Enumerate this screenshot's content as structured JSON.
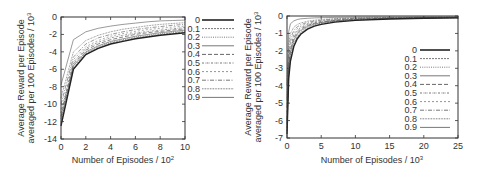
{
  "chart_data": [
    {
      "type": "line",
      "title": "",
      "xlabel": "Number of Episodes / 10",
      "xlabel_sup": "2",
      "ylabel_line1": "Average Reward per Episode",
      "ylabel_line2": "averaged per 100 Episodes / 10",
      "ylabel_sup": "3",
      "xlim": [
        0,
        10
      ],
      "ylim": [
        -14,
        0
      ],
      "xticks": [
        0,
        2,
        4,
        6,
        8,
        10
      ],
      "yticks": [
        0,
        -2,
        -4,
        -6,
        -8,
        -10,
        -12,
        -14
      ],
      "grid": false,
      "legend_position": "outside-right",
      "x": [
        0,
        1,
        2,
        3,
        4,
        5,
        6,
        7,
        8,
        9,
        10
      ],
      "series": [
        {
          "name": "0",
          "style": "solid-thick",
          "values": [
            -12.5,
            -6.0,
            -4.3,
            -3.6,
            -3.1,
            -2.8,
            -2.5,
            -2.3,
            -2.1,
            -1.95,
            -1.8
          ]
        },
        {
          "name": "0.1",
          "style": "dash-fine",
          "values": [
            -12.2,
            -5.9,
            -4.2,
            -3.5,
            -3.0,
            -2.7,
            -2.4,
            -2.2,
            -2.0,
            -1.85,
            -1.7
          ]
        },
        {
          "name": "0.2",
          "style": "dot",
          "values": [
            -12.0,
            -5.8,
            -4.1,
            -3.4,
            -2.9,
            -2.6,
            -2.3,
            -2.1,
            -1.9,
            -1.75,
            -1.6
          ]
        },
        {
          "name": "0.3",
          "style": "solid-thin",
          "values": [
            -11.7,
            -5.6,
            -4.0,
            -3.3,
            -2.8,
            -2.5,
            -2.2,
            -2.0,
            -1.8,
            -1.65,
            -1.5
          ]
        },
        {
          "name": "0.4",
          "style": "dash-long",
          "values": [
            -11.4,
            -5.4,
            -3.8,
            -3.1,
            -2.6,
            -2.3,
            -2.0,
            -1.8,
            -1.65,
            -1.5,
            -1.35
          ]
        },
        {
          "name": "0.5",
          "style": "dash-dot-fine",
          "values": [
            -11.0,
            -5.2,
            -3.6,
            -2.9,
            -2.4,
            -2.1,
            -1.85,
            -1.65,
            -1.5,
            -1.35,
            -1.2
          ]
        },
        {
          "name": "0.6",
          "style": "dash-short",
          "values": [
            -10.6,
            -4.9,
            -3.4,
            -2.7,
            -2.2,
            -1.9,
            -1.65,
            -1.45,
            -1.3,
            -1.15,
            -1.05
          ]
        },
        {
          "name": "0.7",
          "style": "dash-dot",
          "values": [
            -10.0,
            -4.6,
            -3.1,
            -2.4,
            -2.0,
            -1.7,
            -1.45,
            -1.25,
            -1.1,
            -0.95,
            -0.85
          ]
        },
        {
          "name": "0.8",
          "style": "dot-dense",
          "values": [
            -9.3,
            -4.0,
            -2.7,
            -2.1,
            -1.7,
            -1.4,
            -1.2,
            -1.0,
            -0.85,
            -0.75,
            -0.65
          ]
        },
        {
          "name": "0.9",
          "style": "solid-thin",
          "values": [
            -7.8,
            -2.6,
            -1.7,
            -1.3,
            -1.05,
            -0.85,
            -0.7,
            -0.55,
            -0.45,
            -0.4,
            -0.35
          ]
        }
      ]
    },
    {
      "type": "line",
      "title": "",
      "xlabel": "Number of Episodes / 10",
      "xlabel_sup": "3",
      "ylabel_line1": "Average Reward per Episode",
      "ylabel_line2": "averaged per 100 Episodes / 10",
      "ylabel_sup": "3",
      "xlim": [
        0,
        25
      ],
      "ylim": [
        -7,
        0
      ],
      "xticks": [
        0,
        5,
        10,
        15,
        20,
        25
      ],
      "yticks": [
        0,
        -1,
        -2,
        -3,
        -4,
        -5,
        -6,
        -7
      ],
      "grid": false,
      "legend_position": "inside-lower-right",
      "x": [
        0,
        0.25,
        0.5,
        1,
        1.5,
        2,
        3,
        4,
        5,
        7,
        10,
        15,
        20,
        25
      ],
      "series": [
        {
          "name": "0",
          "style": "solid-thick",
          "values": [
            -6.8,
            -3.6,
            -2.6,
            -1.75,
            -1.3,
            -1.05,
            -0.75,
            -0.58,
            -0.48,
            -0.35,
            -0.25,
            -0.17,
            -0.13,
            -0.11
          ]
        },
        {
          "name": "0.1",
          "style": "dash-fine",
          "values": [
            -6.6,
            -3.4,
            -2.45,
            -1.6,
            -1.2,
            -0.97,
            -0.7,
            -0.54,
            -0.44,
            -0.32,
            -0.23,
            -0.16,
            -0.12,
            -0.1
          ]
        },
        {
          "name": "0.2",
          "style": "dot",
          "values": [
            -6.4,
            -3.2,
            -2.3,
            -1.5,
            -1.1,
            -0.9,
            -0.64,
            -0.5,
            -0.41,
            -0.3,
            -0.21,
            -0.15,
            -0.11,
            -0.1
          ]
        },
        {
          "name": "0.3",
          "style": "solid-thin",
          "values": [
            -6.2,
            -3.0,
            -2.1,
            -1.38,
            -1.02,
            -0.83,
            -0.59,
            -0.46,
            -0.38,
            -0.28,
            -0.2,
            -0.14,
            -0.11,
            -0.09
          ]
        },
        {
          "name": "0.4",
          "style": "dash-long",
          "values": [
            -6.0,
            -2.8,
            -1.95,
            -1.25,
            -0.93,
            -0.75,
            -0.54,
            -0.42,
            -0.35,
            -0.26,
            -0.18,
            -0.13,
            -0.1,
            -0.09
          ]
        },
        {
          "name": "0.5",
          "style": "dash-dot-fine",
          "values": [
            -5.8,
            -2.55,
            -1.75,
            -1.12,
            -0.83,
            -0.67,
            -0.48,
            -0.38,
            -0.31,
            -0.23,
            -0.17,
            -0.12,
            -0.1,
            -0.08
          ]
        },
        {
          "name": "0.6",
          "style": "dash-short",
          "values": [
            -5.5,
            -2.3,
            -1.55,
            -0.98,
            -0.73,
            -0.59,
            -0.43,
            -0.34,
            -0.28,
            -0.21,
            -0.15,
            -0.11,
            -0.09,
            -0.08
          ]
        },
        {
          "name": "0.7",
          "style": "dash-dot",
          "values": [
            -5.2,
            -2.0,
            -1.3,
            -0.83,
            -0.62,
            -0.5,
            -0.37,
            -0.29,
            -0.24,
            -0.18,
            -0.13,
            -0.1,
            -0.08,
            -0.07
          ]
        },
        {
          "name": "0.8",
          "style": "dot-dense",
          "values": [
            -4.8,
            -1.6,
            -1.0,
            -0.65,
            -0.49,
            -0.4,
            -0.3,
            -0.24,
            -0.2,
            -0.15,
            -0.11,
            -0.09,
            -0.07,
            -0.06
          ]
        },
        {
          "name": "0.9",
          "style": "solid-thin",
          "values": [
            -4.0,
            -0.9,
            -0.45,
            -0.28,
            -0.2,
            -0.16,
            -0.13,
            -0.11,
            -0.1,
            -0.08,
            -0.07,
            -0.06,
            -0.05,
            -0.05
          ]
        }
      ]
    }
  ],
  "colors": {
    "axis": "#333333",
    "line_dark": "#222222",
    "line_mid": "#555555",
    "line_light": "#777777",
    "background": "#ffffff"
  }
}
